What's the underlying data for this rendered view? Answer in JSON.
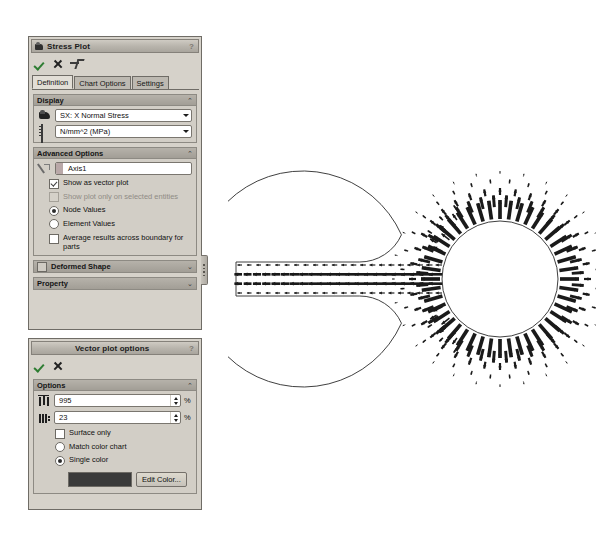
{
  "stress_plot_panel": {
    "title": "Stress Plot",
    "title_icon": "stress-plot-icon",
    "help_label": "?",
    "actions": {
      "ok_label": "OK",
      "cancel_label": "Cancel",
      "pin_label": "Keep Visible"
    },
    "tabs": [
      {
        "label": "Definition",
        "active": true
      },
      {
        "label": "Chart Options",
        "active": false
      },
      {
        "label": "Settings",
        "active": false
      }
    ],
    "display": {
      "header": "Display",
      "collapse_glyph": "⌃",
      "component_combo": {
        "icon": "plot-component-icon",
        "value": "SX: X Normal Stress"
      },
      "units_combo": {
        "icon": "units-ruler-icon",
        "value": "N/mm^2 (MPa)"
      }
    },
    "advanced_options": {
      "header": "Advanced Options",
      "collapse_glyph": "⌃",
      "reference_field": {
        "icon": "selection-pointer-icon",
        "value": "Axis1"
      },
      "checkboxes": [
        {
          "label": "Show as vector plot",
          "checked": true,
          "disabled": false
        },
        {
          "label": "Show plot only on selected entities",
          "checked": false,
          "disabled": true
        }
      ],
      "value_mode": [
        {
          "label": "Node Values",
          "selected": true
        },
        {
          "label": "Element Values",
          "selected": false
        }
      ],
      "average_checkbox": {
        "label": "Average results across boundary for parts",
        "checked": false
      }
    },
    "deformed_shape": {
      "label": "Deformed Shape",
      "checked": false,
      "expand_glyph": "⌄"
    },
    "property": {
      "label": "Property",
      "expand_glyph": "⌄"
    }
  },
  "vector_plot_panel": {
    "title": "Vector plot options",
    "help_label": "?",
    "actions": {
      "ok_label": "OK",
      "cancel_label": "Cancel"
    },
    "options": {
      "header": "Options",
      "collapse_glyph": "⌃",
      "size_field": {
        "icon": "vector-size-icon",
        "value": "995",
        "unit": "%"
      },
      "density_field": {
        "icon": "vector-density-icon",
        "value": "23",
        "unit": "%"
      },
      "surface_only": {
        "label": "Surface only",
        "checked": false
      },
      "color_mode": [
        {
          "label": "Match color chart",
          "selected": false
        },
        {
          "label": "Single color",
          "selected": true
        }
      ],
      "color_swatch": "#3a3a3a",
      "edit_color_button": "Edit Color..."
    }
  },
  "chart_data": {
    "type": "scatter",
    "title": "",
    "xlabel": "",
    "ylabel": "",
    "geometry": {
      "arm": {
        "x0": 8,
        "y0": 112,
        "x1": 212,
        "y1": 146
      },
      "disc": {
        "cx": 272,
        "cy": 129,
        "r": 108
      },
      "hole": {
        "cx": 272,
        "cy": 129,
        "r": 58
      },
      "fillet_radius": 46
    },
    "vector_field": {
      "arm_rows": 4,
      "arm_columns": 22,
      "arm_direction_deg": 180,
      "hole_ring_counts": [
        44,
        40,
        36,
        32,
        28
      ],
      "hole_ring_radii": [
        60,
        72,
        84,
        96,
        105
      ],
      "max_arrow_length_px": 16,
      "min_arrow_length_px": 3,
      "color": "#1a1a1a"
    }
  }
}
